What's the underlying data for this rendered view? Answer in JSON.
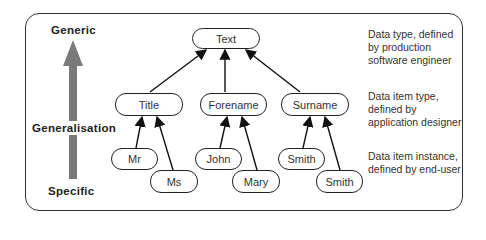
{
  "axis": {
    "top_label": "Generic",
    "middle_label": "Generalisation",
    "bottom_label": "Specific",
    "arrow_color": "#7a7a7a"
  },
  "nodes": {
    "root": "Text",
    "level2": [
      "Title",
      "Forename",
      "Surname"
    ],
    "level3": [
      "Mr",
      "Ms",
      "John",
      "Mary",
      "Smith",
      "Smith"
    ]
  },
  "descriptions": [
    {
      "lines": [
        "Data type, defined",
        "by production",
        "software engineer"
      ]
    },
    {
      "lines": [
        "Data item type,",
        "defined by",
        "application designer"
      ]
    },
    {
      "lines": [
        "Data item instance,",
        "defined by end-user"
      ]
    }
  ]
}
